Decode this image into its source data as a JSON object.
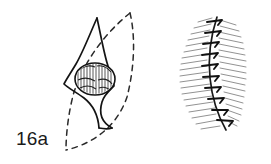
{
  "plate": {
    "background_color": "#ffffff",
    "ink_color": "#1a1a1a",
    "hatch_color": "#555555",
    "width": 271,
    "height": 164
  },
  "figures": [
    {
      "id": "16a",
      "caption": "16a",
      "title": "Lenticular excision design",
      "elements": {
        "planned_incision": "dashed-ellipse-outline",
        "lesion_outline": "solid-sigmoid-curve",
        "nodule": "hatched-oval-nodule"
      }
    },
    {
      "id": "16b",
      "caption": "16b",
      "title": "Sutured linear closure",
      "elements": {
        "suture_line": "solid-vertical-curve",
        "stitches": "cross-stitch-marks",
        "tissue_hatching": "fine-hatch-strokes"
      }
    }
  ]
}
